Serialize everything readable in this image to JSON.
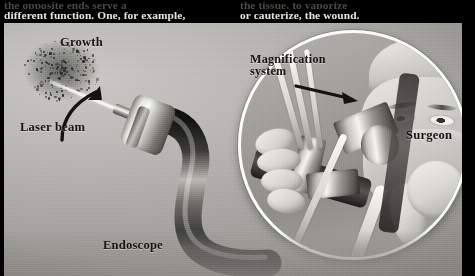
{
  "page": {
    "background_color": "#000000",
    "plate_tone": "#b0afaa"
  },
  "body_text": {
    "left_column": {
      "clipped_line": "the opposite ends serve a",
      "line": "different function. One, for example,"
    },
    "right_column": {
      "clipped_line": "the tissue, to vaporize",
      "line": "or cauterize, the wound."
    }
  },
  "illustration": {
    "caption_labels": [
      {
        "id": "growth",
        "text": "Growth"
      },
      {
        "id": "laser",
        "text": "Laser beam"
      },
      {
        "id": "endoscope",
        "text": "Endoscope"
      },
      {
        "id": "surgeon",
        "text": "Surgeon"
      }
    ],
    "magnification_label": {
      "line1": "Magnification",
      "line2": "system"
    },
    "icons": {
      "growth_pointer": "curved-arrow-icon",
      "magnification_pointer": "straight-arrow-icon",
      "inset": "magnifier-circle-icon"
    }
  }
}
